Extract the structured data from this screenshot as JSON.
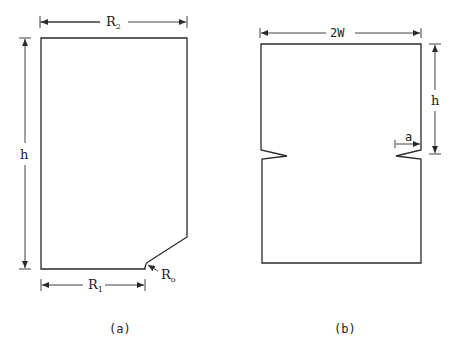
{
  "figure": {
    "panel_a": {
      "caption": "(a)",
      "labels": {
        "top_width": {
          "base": "R",
          "sub": "2"
        },
        "height": "h",
        "bottom_width": {
          "base": "R",
          "sub": "1"
        },
        "fillet_radius": {
          "base": "R",
          "sub": "o"
        }
      }
    },
    "panel_b": {
      "caption": "(b)",
      "labels": {
        "width": "2W",
        "height": "h",
        "notch_depth": "a"
      }
    }
  },
  "colors": {
    "line": "#2a2a2a",
    "background": "#ffffff"
  }
}
